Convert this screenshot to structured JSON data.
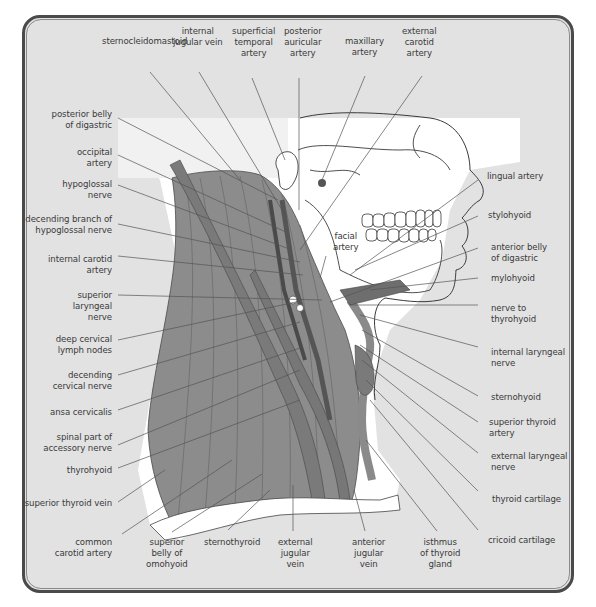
{
  "diagram": {
    "type": "anatomical illustration",
    "colors": {
      "background": "#e2e2e2",
      "frame_border": "#4a4a4a",
      "muscle": "#8c8c8c",
      "muscle_dark": "#6e6e6e",
      "skin_bone": "#ffffff",
      "leader_line": "#555555",
      "label_text": "#3a3a3a"
    }
  },
  "labels": {
    "top": [
      {
        "id": "sternocleidomastoid",
        "text": "sternocleidomastoid"
      },
      {
        "id": "internal_jugular_vein",
        "text": "internal\njugular vein"
      },
      {
        "id": "superficial_temporal_artery",
        "text": "superficial\ntemporal\nartery"
      },
      {
        "id": "posterior_auricular_artery",
        "text": "posterior\nauricular\nartery"
      },
      {
        "id": "maxillary_artery",
        "text": "maxillary\nartery"
      },
      {
        "id": "external_carotid_artery",
        "text": "external\ncarotid\nartery"
      }
    ],
    "left": [
      {
        "id": "posterior_belly_of_digastric",
        "text": "posterior belly\nof digastric"
      },
      {
        "id": "occipital_artery",
        "text": "occipital\nartery"
      },
      {
        "id": "hypoglossal_nerve",
        "text": "hypoglossal\nnerve"
      },
      {
        "id": "decending_branch_of_hypoglossal_nerve",
        "text": "decending branch of\nhypoglossal nerve"
      },
      {
        "id": "internal_carotid_artery",
        "text": "internal carotid\nartery"
      },
      {
        "id": "superior_laryngeal_nerve",
        "text": "superior\nlaryngeal\nnerve"
      },
      {
        "id": "deep_cervical_lymph_nodes",
        "text": "deep cervical\nlymph nodes"
      },
      {
        "id": "decending_cervical_nerve",
        "text": "decending\ncervical nerve"
      },
      {
        "id": "ansa_cervicalis",
        "text": "ansa cervicalis"
      },
      {
        "id": "spinal_part_of_accessory_nerve",
        "text": "spinal part of\naccessory nerve"
      },
      {
        "id": "thyrohyoid",
        "text": "thyrohyoid"
      },
      {
        "id": "superior_thyroid_vein",
        "text": "superior thyroid vein"
      }
    ],
    "right": [
      {
        "id": "lingual_artery",
        "text": "lingual artery"
      },
      {
        "id": "stylohyoid",
        "text": "stylohyoid"
      },
      {
        "id": "anterior_belly_of_digastric",
        "text": "anterior belly\nof digastric"
      },
      {
        "id": "mylohyoid",
        "text": "mylohyoid"
      },
      {
        "id": "nerve_to_thyrohyoid",
        "text": "nerve to\nthyrohyoid"
      },
      {
        "id": "internal_laryngeal_nerve",
        "text": "internal laryngeal\nnerve"
      },
      {
        "id": "sternohyoid",
        "text": "sternohyoid"
      },
      {
        "id": "superior_thyroid_artery",
        "text": "superior thyroid\nartery"
      },
      {
        "id": "external_laryngeal_nerve",
        "text": "external laryngeal\nnerve"
      },
      {
        "id": "thyroid_cartilage",
        "text": "thyroid cartilage"
      },
      {
        "id": "cricoid_cartilage",
        "text": "cricoid cartilage"
      }
    ],
    "bottom": [
      {
        "id": "common_carotid_artery",
        "text": "common\ncarotid artery"
      },
      {
        "id": "superior_belly_of_omohyoid",
        "text": "superior\nbelly of\nomohyoid"
      },
      {
        "id": "sternothyroid",
        "text": "sternothyroid"
      },
      {
        "id": "external_jugular_vein",
        "text": "external\njugular\nvein"
      },
      {
        "id": "anterior_jugular_vein",
        "text": "anterior\njugular\nvein"
      },
      {
        "id": "isthmus_of_thyroid_gland",
        "text": "isthmus\nof thyroid\ngland"
      }
    ],
    "inline": [
      {
        "id": "facial_artery",
        "text": "facial\nartery"
      }
    ]
  }
}
